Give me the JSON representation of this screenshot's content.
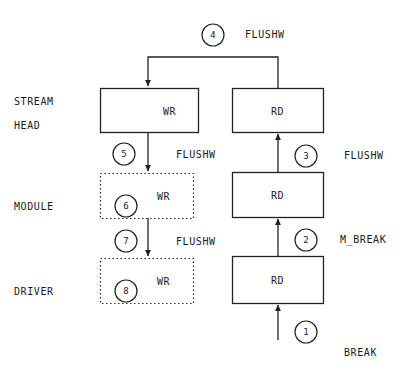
{
  "diagram": {
    "stroke_color": "#222222",
    "background_color": "#ffffff",
    "layers": [
      {
        "id": "stream-head",
        "label_line1": "STREAM",
        "label_line2": "HEAD"
      },
      {
        "id": "module",
        "label_line1": "MODULE",
        "label_line2": ""
      },
      {
        "id": "driver",
        "label_line1": "DRIVER",
        "label_line2": ""
      }
    ],
    "boxes": [
      {
        "id": "wr-stream-head",
        "text": "WR",
        "border": "solid",
        "column": "write",
        "layer": "stream-head"
      },
      {
        "id": "rd-stream-head",
        "text": "RD",
        "border": "solid",
        "column": "read",
        "layer": "stream-head"
      },
      {
        "id": "wr-module",
        "text": "WR",
        "border": "dotted",
        "column": "write",
        "layer": "module"
      },
      {
        "id": "rd-module",
        "text": "RD",
        "border": "solid",
        "column": "read",
        "layer": "module"
      },
      {
        "id": "wr-driver",
        "text": "WR",
        "border": "dotted",
        "column": "write",
        "layer": "driver"
      },
      {
        "id": "rd-driver",
        "text": "RD",
        "border": "solid",
        "column": "read",
        "layer": "driver"
      }
    ],
    "steps": [
      {
        "num": "1",
        "label": "BREAK",
        "label_position": "right-outer"
      },
      {
        "num": "2",
        "label": "M_BREAK",
        "label_position": "right-outer"
      },
      {
        "num": "3",
        "label": "FLUSHW",
        "label_position": "right-outer"
      },
      {
        "num": "4",
        "label": "FLUSHW",
        "label_position": "top"
      },
      {
        "num": "5",
        "label": "FLUSHW",
        "label_position": "middle"
      },
      {
        "num": "6",
        "label": "",
        "label_position": "in-box"
      },
      {
        "num": "7",
        "label": "FLUSHW",
        "label_position": "middle"
      },
      {
        "num": "8",
        "label": "",
        "label_position": "in-box"
      }
    ]
  }
}
